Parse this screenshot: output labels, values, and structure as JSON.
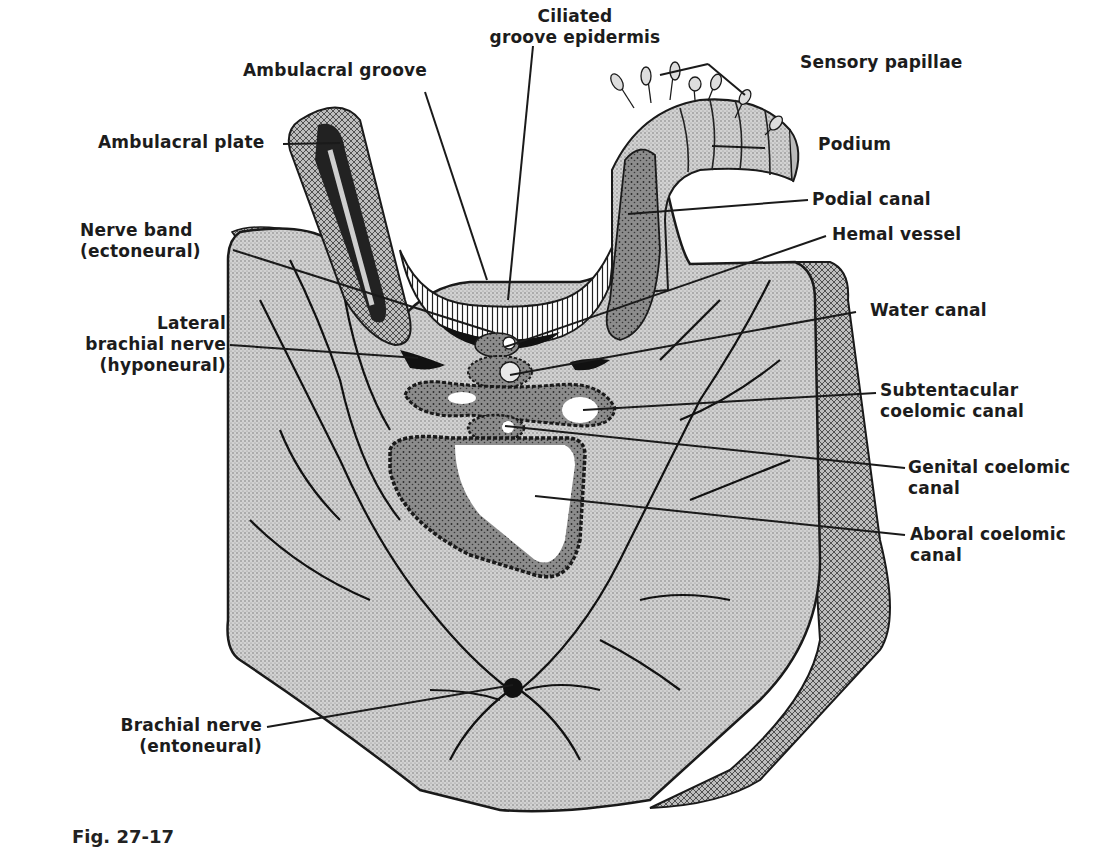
{
  "figure": {
    "caption": "Fig. 27-17",
    "colors": {
      "background": "#ffffff",
      "tissue_stipple": "#c8c8c8",
      "dark_cavity": "#8a8a8a",
      "ink": "#1a1a1a",
      "lumen": "#ffffff"
    }
  },
  "labels": {
    "ciliated_groove_epidermis": {
      "line1": "Ciliated",
      "line2": "groove epidermis"
    },
    "ambulacral_groove": {
      "line1": "Ambulacral groove"
    },
    "sensory_papillae": {
      "line1": "Sensory papillae"
    },
    "ambulacral_plate": {
      "line1": "Ambulacral plate"
    },
    "podium": {
      "line1": "Podium"
    },
    "podial_canal": {
      "line1": "Podial canal"
    },
    "nerve_band": {
      "line1": "Nerve band",
      "line2": "(ectoneural)"
    },
    "hemal_vessel": {
      "line1": "Hemal vessel"
    },
    "lateral_brachial_nerve": {
      "line1": "Lateral",
      "line2": "brachial  nerve",
      "line3": "(hyponeural)"
    },
    "water_canal": {
      "line1": "Water canal"
    },
    "subtentacular_coelomic_canal": {
      "line1": "Subtentacular",
      "line2": "coelomic canal"
    },
    "genital_coelomic_canal": {
      "line1": "Genital coelomic",
      "line2": "canal"
    },
    "aboral_coelomic_canal": {
      "line1": "Aboral coelomic",
      "line2": "canal"
    },
    "brachial_nerve": {
      "line1": "Brachial nerve",
      "line2": "(entoneural)"
    }
  }
}
